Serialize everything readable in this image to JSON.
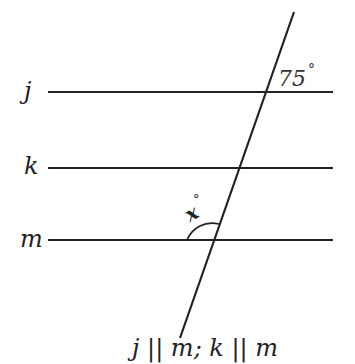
{
  "diagram": {
    "type": "parallel-lines-transversal",
    "lines": [
      {
        "name": "j",
        "label": "j",
        "y": 92
      },
      {
        "name": "k",
        "label": "k",
        "y": 168
      },
      {
        "name": "m",
        "label": "m",
        "y": 240
      }
    ],
    "angles": {
      "given": {
        "value": "75",
        "degree": "°",
        "at_line": "j",
        "position": "upper-right"
      },
      "unknown": {
        "value": "x",
        "degree": "°",
        "at_line": "m",
        "position": "upper-left"
      }
    },
    "caption": "j || m; k || m",
    "colors": {
      "stroke": "#222222",
      "background": "#ffffff"
    }
  }
}
